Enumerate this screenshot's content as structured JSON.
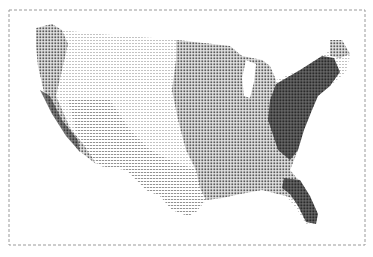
{
  "map": {
    "type": "choropleth-dot-density",
    "subject": "contiguous United States",
    "rendering": "line-printer character shading",
    "frame": {
      "x": 9,
      "y": 10,
      "width": 356,
      "height": 235,
      "tick_marks": true
    },
    "shading_levels": [
      {
        "level": 1,
        "tone": "lightest",
        "pattern": "dashes",
        "color": "#c8c8c8"
      },
      {
        "level": 2,
        "tone": "light",
        "pattern": "sparse dots",
        "color": "#a8a8a8"
      },
      {
        "level": 3,
        "tone": "medium",
        "pattern": "dot grid",
        "color": "#7a7a7a"
      },
      {
        "level": 4,
        "tone": "dark",
        "pattern": "dense grid",
        "color": "#3c3c3c"
      }
    ],
    "regions": [
      {
        "name": "Pacific Northwest",
        "level": 3
      },
      {
        "name": "California / Pacific coast",
        "level": 4
      },
      {
        "name": "Great Basin / Mountain West",
        "level": 1
      },
      {
        "name": "Great Plains",
        "level": 1
      },
      {
        "name": "Southwest",
        "level": 2
      },
      {
        "name": "Texas",
        "level": 2
      },
      {
        "name": "Midwest",
        "level": 3
      },
      {
        "name": "South / Gulf Coast",
        "level": 3
      },
      {
        "name": "Northeast",
        "level": 4
      },
      {
        "name": "Mid-Atlantic",
        "level": 4
      },
      {
        "name": "Florida",
        "level": 4
      },
      {
        "name": "Maine",
        "level": 3
      }
    ],
    "lakes": [
      "Lake Michigan"
    ]
  }
}
